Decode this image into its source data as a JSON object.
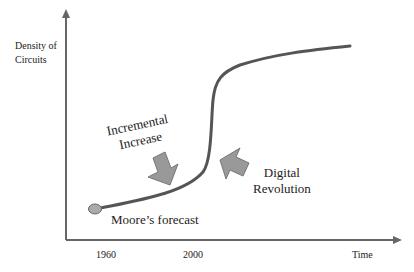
{
  "diagram": {
    "type": "s-curve",
    "y_axis_label_line1": "Density of",
    "y_axis_label_line2": "Circuits",
    "x_axis_label": "Time",
    "x_ticks": [
      "1960",
      "2000"
    ],
    "annotations": {
      "incremental_line1": "Incremental",
      "incremental_line2": "Increase",
      "digital_line1": "Digital",
      "digital_line2": "Revolution",
      "start_point": "Moore’s forecast"
    },
    "colors": {
      "axis": "#666666",
      "curve": "#555555",
      "arrow_fill": "#999999",
      "arrow_stroke": "#777777",
      "point_fill": "#aaaaaa",
      "text": "#222222"
    }
  }
}
